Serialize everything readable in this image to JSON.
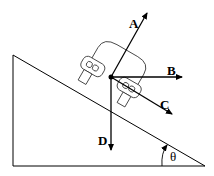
{
  "diagram": {
    "type": "physics free-body diagram",
    "vectors": [
      {
        "label": "A",
        "direction": "up-right, perpendicular-ish to incline"
      },
      {
        "label": "B",
        "direction": "horizontal right"
      },
      {
        "label": "C",
        "direction": "down along incline"
      },
      {
        "label": "D",
        "direction": "vertically down"
      }
    ],
    "angle_label": "θ"
  },
  "labels": {
    "a": "A",
    "b": "B",
    "c": "C",
    "d": "D",
    "theta": "θ"
  }
}
